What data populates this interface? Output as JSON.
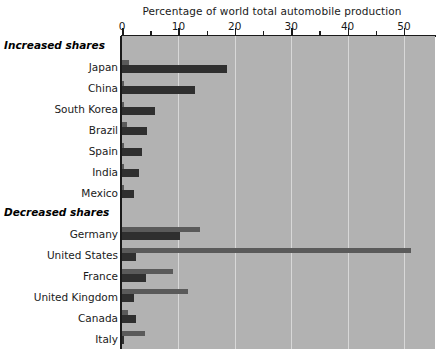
{
  "chart_data": {
    "type": "bar",
    "orientation": "horizontal",
    "title": "",
    "xlabel": "Percentage of world total automobile production",
    "ylabel": "",
    "xlim": [
      0,
      55.5
    ],
    "xticks": [
      0,
      10,
      20,
      30,
      40,
      50
    ],
    "xtick_labels": [
      "0",
      "10",
      "20",
      "30",
      "40",
      "50"
    ],
    "minor_xticks": [
      5,
      15,
      25,
      35,
      45
    ],
    "grid": "vertical",
    "legend_position": "bottom-right",
    "groups": [
      {
        "label": "Increased shares",
        "categories": [
          "Japan",
          "China",
          "South Korea",
          "Brazil",
          "Spain",
          "India",
          "Mexico"
        ]
      },
      {
        "label": "Decreased shares",
        "categories": [
          "Germany",
          "United States",
          "France",
          "United Kingdom",
          "Canada",
          "Italy"
        ]
      }
    ],
    "categories": [
      "Japan",
      "China",
      "South Korea",
      "Brazil",
      "Spain",
      "India",
      "Mexico",
      "Germany",
      "United States",
      "France",
      "United Kingdom",
      "Canada",
      "Italy"
    ],
    "series": [
      {
        "name": "1960",
        "color": "#5a5a5a",
        "values": [
          1.3,
          0.2,
          0.1,
          0.8,
          0.4,
          0.2,
          0.3,
          13.8,
          51.2,
          9.0,
          11.7,
          1.1,
          4.0
        ]
      },
      {
        "name": "2007",
        "color": "#2f2f2f",
        "values": [
          18.7,
          12.9,
          5.8,
          4.4,
          3.5,
          3.0,
          2.1,
          10.2,
          2.5,
          4.2,
          2.1,
          2.5,
          0.3
        ]
      }
    ]
  },
  "legend": {
    "items": [
      {
        "label": "1960",
        "color": "#5a5a5a"
      },
      {
        "label": "2007",
        "color": "#2f2f2f"
      }
    ]
  },
  "caption": ""
}
